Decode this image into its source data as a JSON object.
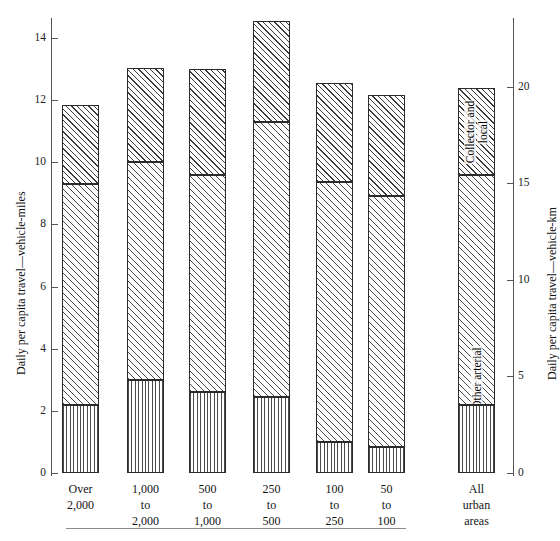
{
  "chart_data": {
    "type": "bar",
    "subtype": "stacked-bar",
    "title": "",
    "categories": [
      "Over 2,000",
      "1,000 to 2,000",
      "500 to 1,000",
      "250 to 500",
      "100 to 250",
      "50 to 100",
      "All urban areas"
    ],
    "category_lines": [
      [
        "Over",
        "2,000"
      ],
      [
        "1,000",
        "to",
        "2,000"
      ],
      [
        "500",
        "to",
        "1,000"
      ],
      [
        "250",
        "to",
        "500"
      ],
      [
        "100",
        "to",
        "250"
      ],
      [
        "50",
        "to",
        "100"
      ],
      [
        "All",
        "urban",
        "areas"
      ]
    ],
    "series": [
      {
        "name": "Interstate",
        "values": [
          2.18,
          3.0,
          2.62,
          2.45,
          1.0,
          0.84,
          2.2
        ]
      },
      {
        "name": "Other arterial",
        "values": [
          7.12,
          7.0,
          6.98,
          8.85,
          8.36,
          8.06,
          7.4
        ]
      },
      {
        "name": "Collector and local",
        "values": [
          2.55,
          3.05,
          3.4,
          3.25,
          3.19,
          3.27,
          2.8
        ]
      }
    ],
    "cumulative_tops": [
      [
        2.18,
        9.3,
        11.85
      ],
      [
        3.0,
        10.0,
        13.05
      ],
      [
        2.62,
        9.6,
        13.0
      ],
      [
        2.45,
        11.3,
        14.55
      ],
      [
        1.0,
        9.36,
        12.55
      ],
      [
        0.84,
        8.9,
        12.17
      ],
      [
        2.2,
        9.6,
        12.4
      ]
    ],
    "totals": [
      11.85,
      13.05,
      13.0,
      14.55,
      12.55,
      12.17,
      12.4
    ],
    "xlabel": "",
    "ylabel": "Daily per capita travel—vehicle-miles",
    "ylabel_right": "Daily per capita travel—vehicle-km",
    "ylim": [
      0,
      15.1
    ],
    "yticks": [
      0,
      2,
      4,
      6,
      8,
      10,
      12,
      14
    ],
    "ytick_labels": [
      "0",
      "2",
      "4",
      "6",
      "8",
      "10",
      "12",
      "14"
    ],
    "ylim_right": [
      0,
      24.3
    ],
    "yticks_right": [
      0,
      5,
      10,
      15,
      20
    ],
    "ytick_labels_right": [
      "0",
      "5",
      "10",
      "15",
      "20"
    ],
    "grid": false,
    "legend_position": "in-bar (last bar segments labeled)",
    "legend_entries": [
      "Collector and local",
      "Other arterial",
      "Interstate"
    ],
    "segment_label_lines": {
      "collector": [
        "Collector and",
        "local"
      ],
      "arterial": [
        "Other arterial"
      ],
      "interstate": [
        "Interstate"
      ]
    },
    "colors": {
      "ink": "#2b2b2b",
      "axis": "#555555",
      "rule": "#8a8a8a",
      "background": "#ffffff"
    }
  }
}
